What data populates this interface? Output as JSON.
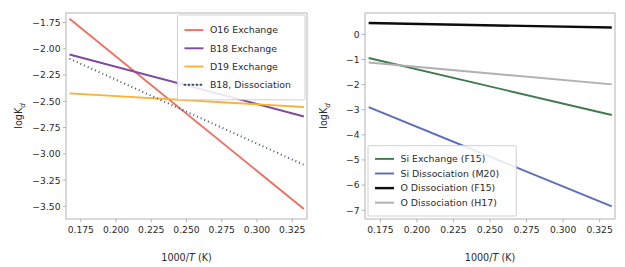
{
  "figure": {
    "background_color": "#ffffff",
    "panel_count": 2
  },
  "chart_data": [
    {
      "panel": "left",
      "type": "line",
      "title": "",
      "xlabel": "1000/T (K)",
      "ylabel": "logKd",
      "xlim": [
        0.1645,
        0.3355
      ],
      "ylim": [
        -3.62,
        -1.66
      ],
      "xticks": [
        0.175,
        0.2,
        0.225,
        0.25,
        0.275,
        0.3,
        0.325
      ],
      "xtick_labels": [
        "0.175",
        "0.200",
        "0.225",
        "0.250",
        "0.275",
        "0.300",
        "0.325"
      ],
      "yticks": [
        -1.75,
        -2.0,
        -2.25,
        -2.5,
        -2.75,
        -3.0,
        -3.25,
        -3.5
      ],
      "ytick_labels": [
        "−1.75",
        "−2.00",
        "−2.25",
        "−2.50",
        "−2.75",
        "−3.00",
        "−3.25",
        "−3.50"
      ],
      "grid": false,
      "legend_position": "upper right",
      "series": [
        {
          "name": "O16 Exchange",
          "color": "#ef6f5e",
          "style": "solid",
          "width": 1.9,
          "x": [
            0.167,
            0.3333
          ],
          "y": [
            -1.715,
            -3.525
          ]
        },
        {
          "name": "B18 Exchange",
          "color": "#7d4a9e",
          "style": "solid",
          "width": 1.9,
          "x": [
            0.167,
            0.3333
          ],
          "y": [
            -2.055,
            -2.645
          ]
        },
        {
          "name": "D19 Exchange",
          "color": "#f9b233",
          "style": "solid",
          "width": 1.9,
          "x": [
            0.167,
            0.3333
          ],
          "y": [
            -2.425,
            -2.555
          ]
        },
        {
          "name": "B18, Dissociation",
          "color": "#3b4a63",
          "style": "dotted",
          "width": 2.0,
          "x": [
            0.167,
            0.3333
          ],
          "y": [
            -2.095,
            -3.105
          ]
        }
      ]
    },
    {
      "panel": "right",
      "type": "line",
      "title": "",
      "xlabel": "1000/T (K)",
      "ylabel": "logKd",
      "xlim": [
        0.1645,
        0.3355
      ],
      "ylim": [
        -7.35,
        0.85
      ],
      "xticks": [
        0.175,
        0.2,
        0.225,
        0.25,
        0.275,
        0.3,
        0.325
      ],
      "xtick_labels": [
        "0.175",
        "0.200",
        "0.225",
        "0.250",
        "0.275",
        "0.300",
        "0.325"
      ],
      "yticks": [
        0,
        -1,
        -2,
        -3,
        -4,
        -5,
        -6,
        -7
      ],
      "ytick_labels": [
        "0",
        "−1",
        "−2",
        "−3",
        "−4",
        "−5",
        "−6",
        "−7"
      ],
      "grid": false,
      "legend_position": "lower left",
      "series": [
        {
          "name": "Si Exchange (F15)",
          "color": "#3f7a4e",
          "style": "solid",
          "width": 1.9,
          "x": [
            0.167,
            0.3333
          ],
          "y": [
            -0.94,
            -3.21
          ]
        },
        {
          "name": "Si Dissociation (M20)",
          "color": "#5a6cc0",
          "style": "solid",
          "width": 1.9,
          "x": [
            0.167,
            0.3333
          ],
          "y": [
            -2.9,
            -6.85
          ]
        },
        {
          "name": "O Dissociation (F15)",
          "color": "#0d0d0d",
          "style": "solid",
          "width": 2.4,
          "x": [
            0.167,
            0.3333
          ],
          "y": [
            0.45,
            0.27
          ]
        },
        {
          "name": "O Dissociation (H17)",
          "color": "#b0b0b0",
          "style": "solid",
          "width": 1.9,
          "x": [
            0.167,
            0.3333
          ],
          "y": [
            -1.12,
            -1.99
          ]
        }
      ]
    }
  ]
}
